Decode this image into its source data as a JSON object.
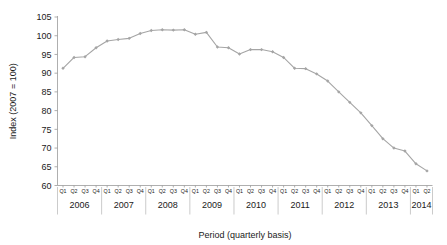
{
  "chart_data": {
    "type": "line",
    "title": "",
    "xlabel": "Period (quarterly basis)",
    "ylabel": "Index (2007 = 100)",
    "ylim": [
      60,
      105
    ],
    "yticks": [
      60,
      65,
      70,
      75,
      80,
      85,
      90,
      95,
      100,
      105
    ],
    "grid": false,
    "legend": "none",
    "line_color": "#a5a5a5",
    "marker": "diamond",
    "marker_color": "#a5a5a5",
    "years": [
      "2006",
      "2007",
      "2008",
      "2009",
      "2010",
      "2011",
      "2012",
      "2013",
      "2014"
    ],
    "quarters_per_year": [
      4,
      4,
      4,
      4,
      4,
      4,
      4,
      4,
      2
    ],
    "quarter_labels": [
      "Q1",
      "Q2",
      "Q3",
      "Q4"
    ],
    "categories": [
      "2006 Q1",
      "2006 Q2",
      "2006 Q3",
      "2006 Q4",
      "2007 Q1",
      "2007 Q2",
      "2007 Q3",
      "2007 Q4",
      "2008 Q1",
      "2008 Q2",
      "2008 Q3",
      "2008 Q4",
      "2009 Q1",
      "2009 Q2",
      "2009 Q3",
      "2009 Q4",
      "2010 Q1",
      "2010 Q2",
      "2010 Q3",
      "2010 Q4",
      "2011 Q1",
      "2011 Q2",
      "2011 Q3",
      "2011 Q4",
      "2012 Q1",
      "2012 Q2",
      "2012 Q3",
      "2012 Q4",
      "2013 Q1",
      "2013 Q2",
      "2013 Q3",
      "2013 Q4",
      "2014 Q1",
      "2014 Q2"
    ],
    "values": [
      91.3,
      94.2,
      94.4,
      96.8,
      98.6,
      99.0,
      99.3,
      100.6,
      101.4,
      101.6,
      101.5,
      101.6,
      100.4,
      100.9,
      97.0,
      96.8,
      95.1,
      96.3,
      96.3,
      95.7,
      94.2,
      91.3,
      91.2,
      89.8,
      87.9,
      85.0,
      82.2,
      79.4,
      76.0,
      72.5,
      70.0,
      69.2,
      65.8,
      63.9
    ],
    "x_axis_group_label": "Period (quarterly basis)"
  }
}
